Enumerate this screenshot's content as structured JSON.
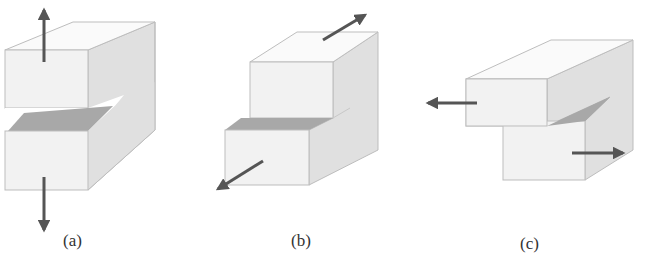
{
  "figure": {
    "colors": {
      "front_face": "#f2f2f2",
      "top_face": "#fafafa",
      "side_face": "#e0e0e0",
      "crack_surface": "#a8a8a8",
      "edge": "#bdbdbd",
      "arrow": "#555555",
      "label": "#333333"
    },
    "panels": [
      {
        "id": "a",
        "label": "(a)",
        "loading": "opening",
        "arrows": [
          {
            "direction": "up",
            "position": "top of upper block"
          },
          {
            "direction": "down",
            "position": "bottom of lower block"
          }
        ]
      },
      {
        "id": "b",
        "label": "(b)",
        "loading": "in-plane shear (sliding)",
        "arrows": [
          {
            "direction": "up-right (backward)",
            "position": "top of upper block"
          },
          {
            "direction": "down-left (forward)",
            "position": "front of lower block"
          }
        ]
      },
      {
        "id": "c",
        "label": "(c)",
        "loading": "out-of-plane shear (tearing)",
        "arrows": [
          {
            "direction": "left",
            "position": "front of upper block"
          },
          {
            "direction": "right",
            "position": "front of lower block"
          }
        ]
      }
    ]
  }
}
